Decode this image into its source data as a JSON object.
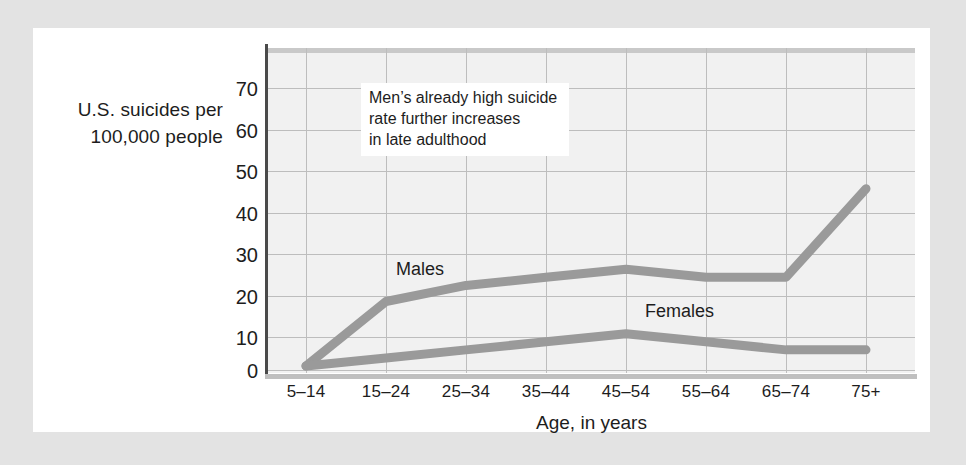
{
  "chart_data": {
    "type": "line",
    "title": "",
    "xlabel": "Age, in years",
    "ylabel": "U.S. suicides per 100,000 people",
    "categories": [
      "5–14",
      "15–24",
      "25–34",
      "35–44",
      "45–54",
      "55–64",
      "65–74",
      "75+"
    ],
    "yticks": [
      0,
      10,
      20,
      30,
      40,
      50,
      60,
      70
    ],
    "ylim": [
      0,
      78
    ],
    "grid": true,
    "legend_position": "inline-labels",
    "series": [
      {
        "name": "Males",
        "color": "#9a9a9a",
        "values": [
          1,
          17,
          21,
          23,
          25,
          23,
          23,
          45
        ]
      },
      {
        "name": "Females",
        "color": "#9a9a9a",
        "values": [
          1,
          3,
          5,
          7,
          9,
          7,
          5,
          5
        ]
      }
    ],
    "annotations": [
      {
        "id": "men-rate-note",
        "lines": [
          "Men’s already high suicide",
          "rate further increases",
          "in late adulthood"
        ]
      }
    ]
  },
  "axes": {
    "y_title_line1": "U.S. suicides per",
    "y_title_line2": "100,000 people",
    "x_title": "Age, in years",
    "y_tick_labels": [
      "70",
      "60",
      "50",
      "40",
      "30",
      "20",
      "10",
      "0"
    ],
    "x_tick_labels": [
      "5–14",
      "15–24",
      "25–34",
      "35–44",
      "45–54",
      "55–64",
      "65–74",
      "75+"
    ]
  },
  "annotation": {
    "line1": "Men’s already high suicide",
    "line2": "rate further increases",
    "line3": "in late adulthood"
  },
  "series_labels": {
    "males": "Males",
    "females": "Females"
  },
  "colors": {
    "page_background": "#e3e3e3",
    "card_background": "#ffffff",
    "plot_background": "#f1f1f1",
    "gridline": "#bdbdbd",
    "axis": "#4a4a4a",
    "series_line": "#9a9a9a",
    "text": "#1d1d1d"
  }
}
